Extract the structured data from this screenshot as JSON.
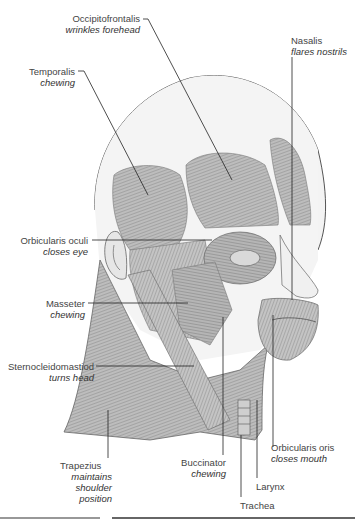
{
  "diagram": {
    "type": "anatomical-illustration",
    "labels": [
      {
        "id": "occipitofrontalis",
        "name": "Occipitofrontalis",
        "function": "wrinkles forehead"
      },
      {
        "id": "nasalis",
        "name": "Nasalis",
        "function": "flares nostrils"
      },
      {
        "id": "temporalis",
        "name": "Temporalis",
        "function": "chewing"
      },
      {
        "id": "orbicularis-oculi",
        "name": "Orbicularis oculi",
        "function": "closes eye"
      },
      {
        "id": "masseter",
        "name": "Masseter",
        "function": "chewing"
      },
      {
        "id": "sternocleidomastoid",
        "name": "Sternocleidomastiod",
        "function": "turns head"
      },
      {
        "id": "trapezius",
        "name": "Trapezius",
        "function_lines": [
          "maintains",
          "shoulder",
          "position"
        ]
      },
      {
        "id": "buccinator",
        "name": "Buccinator",
        "function": "chewing"
      },
      {
        "id": "orbicularis-oris",
        "name": "Orbicularis oris",
        "function": "closes mouth"
      },
      {
        "id": "larynx",
        "name": "Larynx"
      },
      {
        "id": "trachea",
        "name": "Trachea"
      }
    ]
  }
}
